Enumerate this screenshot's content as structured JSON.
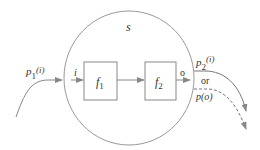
{
  "diagram": {
    "system_label": "s",
    "input_label": "i",
    "input_path_label": "p",
    "input_path_subscript": "1",
    "input_path_arg": "(i)",
    "block1": {
      "label": "f",
      "subscript": "1"
    },
    "block2": {
      "label": "f",
      "subscript": "2"
    },
    "output_label": "o",
    "output_path_label": "p",
    "output_path_subscript": "2",
    "output_path_arg": "(i)",
    "or_label": "or",
    "alt_output_label": "p(o)",
    "colors": {
      "stroke": "#888888",
      "text": "#333333",
      "background": "#ffffff"
    }
  }
}
